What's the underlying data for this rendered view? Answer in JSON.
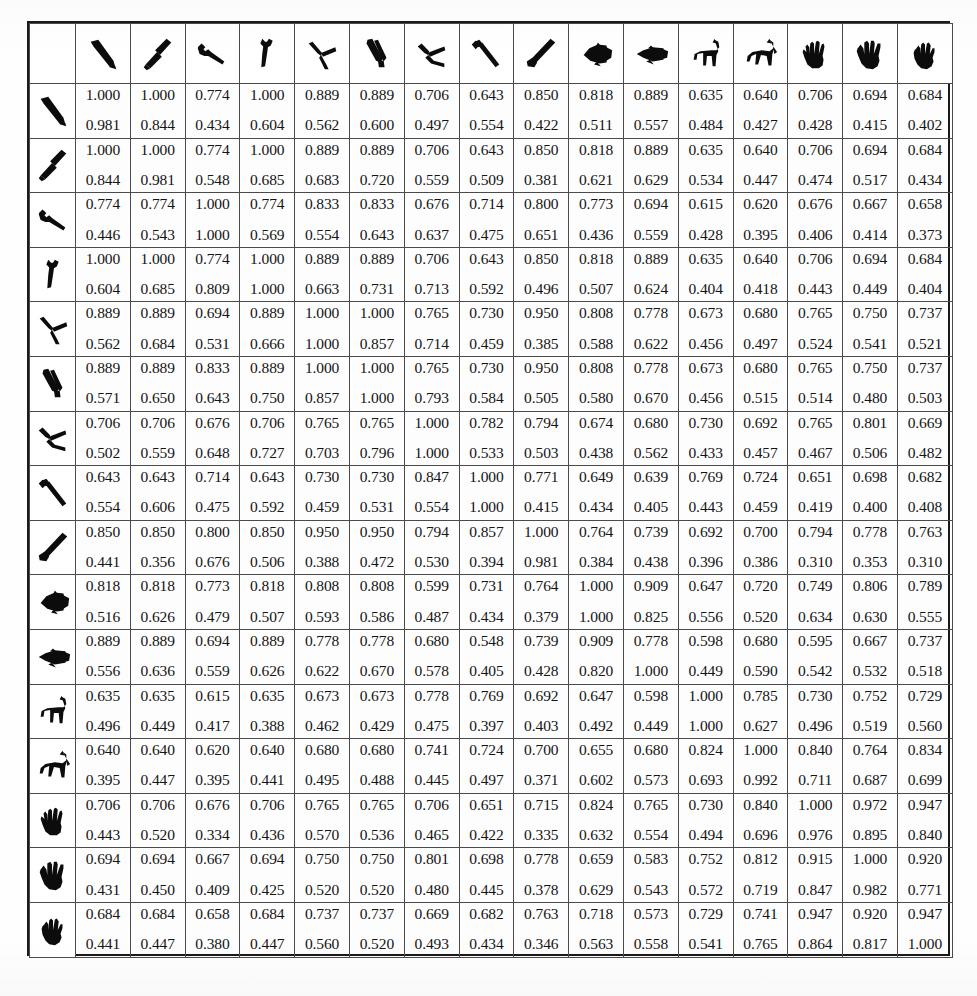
{
  "figure": {
    "kind": "similarity-matrix-table",
    "row_count": 16,
    "column_count": 16,
    "cell_value_count": 2
  },
  "icons": [
    {
      "id": "knife-bent",
      "name": "knife-bent-icon"
    },
    {
      "id": "cleaver",
      "name": "cleaver-icon"
    },
    {
      "id": "wrench-small",
      "name": "wrench-small-icon"
    },
    {
      "id": "wrench-open",
      "name": "wrench-open-icon"
    },
    {
      "id": "pliers-open",
      "name": "pliers-open-icon"
    },
    {
      "id": "pliers-closed",
      "name": "pliers-closed-icon"
    },
    {
      "id": "pincers",
      "name": "pincers-icon"
    },
    {
      "id": "hammer-claw",
      "name": "hammer-claw-icon"
    },
    {
      "id": "hammer-sledge",
      "name": "hammer-sledge-icon"
    },
    {
      "id": "fish-wide",
      "name": "fish-wide-icon"
    },
    {
      "id": "fish-slim",
      "name": "fish-slim-icon"
    },
    {
      "id": "horse-standing",
      "name": "horse-standing-icon"
    },
    {
      "id": "horse-trotting",
      "name": "horse-trotting-icon"
    },
    {
      "id": "hand-open",
      "name": "hand-open-icon"
    },
    {
      "id": "hand-spread",
      "name": "hand-spread-icon"
    },
    {
      "id": "hand-closed",
      "name": "hand-closed-icon"
    }
  ],
  "chart_data": {
    "type": "table",
    "title": "",
    "xlabel": "",
    "ylabel": "",
    "legend": [],
    "grid": true,
    "row_headers": [
      "knife-bent",
      "cleaver",
      "wrench-small",
      "wrench-open",
      "pliers-open",
      "pliers-closed",
      "pincers",
      "hammer-claw",
      "hammer-sledge",
      "fish-wide",
      "fish-slim",
      "horse-standing",
      "horse-trotting",
      "hand-open",
      "hand-spread",
      "hand-closed"
    ],
    "column_headers": [
      "knife-bent",
      "cleaver",
      "wrench-small",
      "wrench-open",
      "pliers-open",
      "pliers-closed",
      "pincers",
      "hammer-claw",
      "hammer-sledge",
      "fish-wide",
      "fish-slim",
      "horse-standing",
      "horse-trotting",
      "hand-open",
      "hand-spread",
      "hand-closed"
    ],
    "series": [
      {
        "name": "upper-value",
        "values": [
          [
            1.0,
            1.0,
            0.774,
            1.0,
            0.889,
            0.889,
            0.706,
            0.643,
            0.85,
            0.818,
            0.889,
            0.635,
            0.64,
            0.706,
            0.694,
            0.684
          ],
          [
            1.0,
            1.0,
            0.774,
            1.0,
            0.889,
            0.889,
            0.706,
            0.643,
            0.85,
            0.818,
            0.889,
            0.635,
            0.64,
            0.706,
            0.694,
            0.684
          ],
          [
            0.774,
            0.774,
            1.0,
            0.774,
            0.833,
            0.833,
            0.676,
            0.714,
            0.8,
            0.773,
            0.694,
            0.615,
            0.62,
            0.676,
            0.667,
            0.658
          ],
          [
            1.0,
            1.0,
            0.774,
            1.0,
            0.889,
            0.889,
            0.706,
            0.643,
            0.85,
            0.818,
            0.889,
            0.635,
            0.64,
            0.706,
            0.694,
            0.684
          ],
          [
            0.889,
            0.889,
            0.694,
            0.889,
            1.0,
            1.0,
            0.765,
            0.73,
            0.95,
            0.808,
            0.778,
            0.673,
            0.68,
            0.765,
            0.75,
            0.737
          ],
          [
            0.889,
            0.889,
            0.833,
            0.889,
            1.0,
            1.0,
            0.765,
            0.73,
            0.95,
            0.808,
            0.778,
            0.673,
            0.68,
            0.765,
            0.75,
            0.737
          ],
          [
            0.706,
            0.706,
            0.676,
            0.706,
            0.765,
            0.765,
            1.0,
            0.782,
            0.794,
            0.674,
            0.68,
            0.73,
            0.692,
            0.765,
            0.801,
            0.669
          ],
          [
            0.643,
            0.643,
            0.714,
            0.643,
            0.73,
            0.73,
            0.847,
            1.0,
            0.771,
            0.649,
            0.639,
            0.769,
            0.724,
            0.651,
            0.698,
            0.682
          ],
          [
            0.85,
            0.85,
            0.8,
            0.85,
            0.95,
            0.95,
            0.794,
            0.857,
            1.0,
            0.764,
            0.739,
            0.692,
            0.7,
            0.794,
            0.778,
            0.763
          ],
          [
            0.818,
            0.818,
            0.773,
            0.818,
            0.808,
            0.808,
            0.599,
            0.731,
            0.764,
            1.0,
            0.909,
            0.647,
            0.72,
            0.749,
            0.806,
            0.789
          ],
          [
            0.889,
            0.889,
            0.694,
            0.889,
            0.778,
            0.778,
            0.68,
            0.548,
            0.739,
            0.909,
            0.778,
            0.598,
            0.68,
            0.595,
            0.667,
            0.737
          ],
          [
            0.635,
            0.635,
            0.615,
            0.635,
            0.673,
            0.673,
            0.778,
            0.769,
            0.692,
            0.647,
            0.598,
            1.0,
            0.785,
            0.73,
            0.752,
            0.729
          ],
          [
            0.64,
            0.64,
            0.62,
            0.64,
            0.68,
            0.68,
            0.741,
            0.724,
            0.7,
            0.655,
            0.68,
            0.824,
            1.0,
            0.84,
            0.764,
            0.834
          ],
          [
            0.706,
            0.706,
            0.676,
            0.706,
            0.765,
            0.765,
            0.706,
            0.651,
            0.715,
            0.824,
            0.765,
            0.73,
            0.84,
            1.0,
            0.972,
            0.947
          ],
          [
            0.694,
            0.694,
            0.667,
            0.694,
            0.75,
            0.75,
            0.801,
            0.698,
            0.778,
            0.659,
            0.583,
            0.752,
            0.812,
            0.915,
            1.0,
            0.92
          ],
          [
            0.684,
            0.684,
            0.658,
            0.684,
            0.737,
            0.737,
            0.669,
            0.682,
            0.763,
            0.718,
            0.573,
            0.729,
            0.741,
            0.947,
            0.92,
            0.947
          ]
        ]
      },
      {
        "name": "lower-value",
        "values": [
          [
            0.981,
            0.844,
            0.434,
            0.604,
            0.562,
            0.6,
            0.497,
            0.554,
            0.422,
            0.511,
            0.557,
            0.484,
            0.427,
            0.428,
            0.415,
            0.402
          ],
          [
            0.844,
            0.981,
            0.548,
            0.685,
            0.683,
            0.72,
            0.559,
            0.509,
            0.381,
            0.621,
            0.629,
            0.534,
            0.447,
            0.474,
            0.517,
            0.434
          ],
          [
            0.446,
            0.543,
            1.0,
            0.569,
            0.554,
            0.643,
            0.637,
            0.475,
            0.651,
            0.436,
            0.559,
            0.428,
            0.395,
            0.406,
            0.414,
            0.373
          ],
          [
            0.604,
            0.685,
            0.809,
            1.0,
            0.663,
            0.731,
            0.713,
            0.592,
            0.496,
            0.507,
            0.624,
            0.404,
            0.418,
            0.443,
            0.449,
            0.404
          ],
          [
            0.562,
            0.684,
            0.531,
            0.666,
            1.0,
            0.857,
            0.714,
            0.459,
            0.385,
            0.588,
            0.622,
            0.456,
            0.497,
            0.524,
            0.541,
            0.521
          ],
          [
            0.571,
            0.65,
            0.643,
            0.75,
            0.857,
            1.0,
            0.793,
            0.584,
            0.505,
            0.58,
            0.67,
            0.456,
            0.515,
            0.514,
            0.48,
            0.503
          ],
          [
            0.502,
            0.559,
            0.648,
            0.727,
            0.703,
            0.796,
            1.0,
            0.533,
            0.503,
            0.438,
            0.562,
            0.433,
            0.457,
            0.467,
            0.506,
            0.482
          ],
          [
            0.554,
            0.606,
            0.475,
            0.592,
            0.459,
            0.531,
            0.554,
            1.0,
            0.415,
            0.434,
            0.405,
            0.443,
            0.459,
            0.419,
            0.4,
            0.408
          ],
          [
            0.441,
            0.356,
            0.676,
            0.506,
            0.388,
            0.472,
            0.53,
            0.394,
            0.981,
            0.384,
            0.438,
            0.396,
            0.386,
            0.31,
            0.353,
            0.31
          ],
          [
            0.516,
            0.626,
            0.479,
            0.507,
            0.593,
            0.586,
            0.487,
            0.434,
            0.379,
            1.0,
            0.825,
            0.556,
            0.52,
            0.634,
            0.63,
            0.555
          ],
          [
            0.556,
            0.636,
            0.559,
            0.626,
            0.622,
            0.67,
            0.578,
            0.405,
            0.428,
            0.82,
            1.0,
            0.449,
            0.59,
            0.542,
            0.532,
            0.518
          ],
          [
            0.496,
            0.449,
            0.417,
            0.388,
            0.462,
            0.429,
            0.475,
            0.397,
            0.403,
            0.492,
            0.449,
            1.0,
            0.627,
            0.496,
            0.519,
            0.56
          ],
          [
            0.395,
            0.447,
            0.395,
            0.441,
            0.495,
            0.488,
            0.445,
            0.497,
            0.371,
            0.602,
            0.573,
            0.693,
            0.992,
            0.711,
            0.687,
            0.699
          ],
          [
            0.443,
            0.52,
            0.334,
            0.436,
            0.57,
            0.536,
            0.465,
            0.422,
            0.335,
            0.632,
            0.554,
            0.494,
            0.696,
            0.976,
            0.895,
            0.84
          ],
          [
            0.431,
            0.45,
            0.409,
            0.425,
            0.52,
            0.52,
            0.48,
            0.445,
            0.378,
            0.629,
            0.543,
            0.572,
            0.719,
            0.847,
            0.982,
            0.771
          ],
          [
            0.441,
            0.447,
            0.38,
            0.447,
            0.56,
            0.52,
            0.493,
            0.434,
            0.346,
            0.563,
            0.558,
            0.541,
            0.765,
            0.864,
            0.817,
            1.0
          ]
        ]
      }
    ]
  },
  "colors": {
    "ink": "#141414",
    "grid_line": "#4a4a4a",
    "frame": "#1a1a1a",
    "background": "#fdfdfd"
  }
}
